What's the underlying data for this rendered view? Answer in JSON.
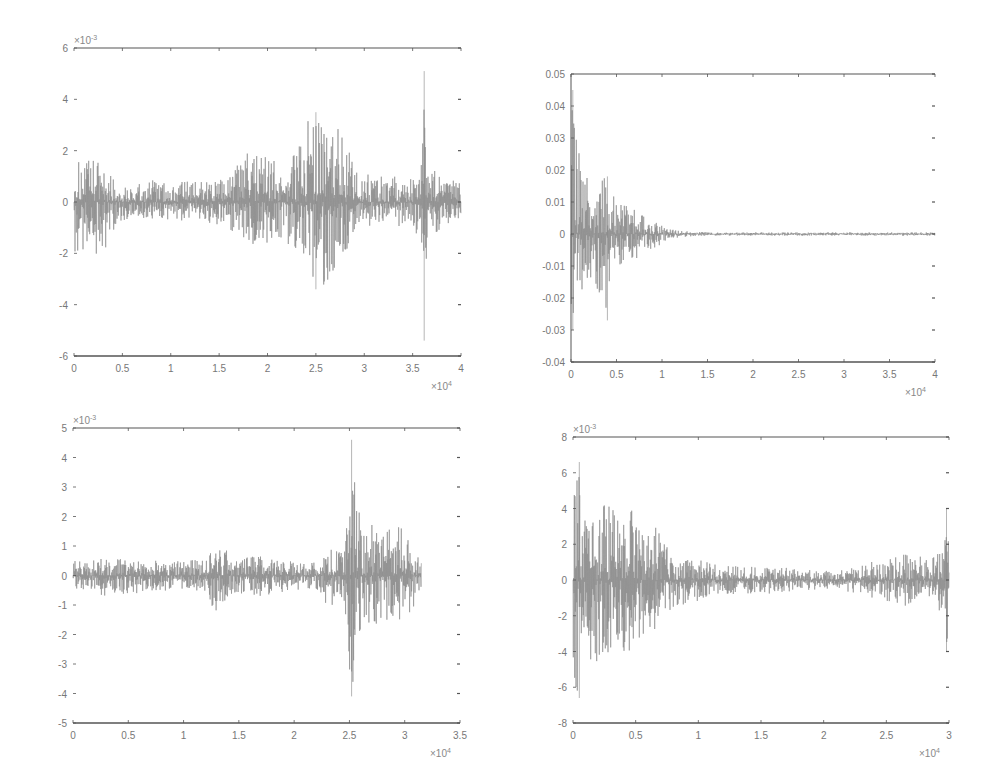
{
  "figure": {
    "background": "#ffffff",
    "signal_color": "#8a8a8a",
    "axis_color": "#555555"
  },
  "chart_data": [
    {
      "type": "line",
      "id": "top-left",
      "title": "",
      "xlabel": "",
      "ylabel": "",
      "x_multiplier": "×10",
      "x_exponent": "4",
      "y_multiplier": "×10",
      "y_exponent": "-3",
      "xlim": [
        0,
        4
      ],
      "ylim": [
        -6,
        6
      ],
      "xticks": [
        0,
        0.5,
        1,
        1.5,
        2,
        2.5,
        3,
        3.5,
        4
      ],
      "xtick_labels": [
        "0",
        "0.5",
        "1",
        "1.5",
        "2",
        "2.5",
        "3",
        "3.5",
        "4"
      ],
      "yticks": [
        6,
        4,
        2,
        0,
        -2,
        -4,
        -6
      ],
      "ytick_labels": [
        "6",
        "4",
        "2",
        "0",
        "-2",
        "-4",
        "-6"
      ],
      "grid": false,
      "box": {
        "left": 74,
        "top": 48,
        "right": 461,
        "bottom": 356,
        "left_line": false
      },
      "signal_extent": [
        0,
        4
      ],
      "envelope": [
        [
          0,
          1.6,
          -2.0
        ],
        [
          0.2,
          1.7,
          -2.1
        ],
        [
          0.3,
          1.8,
          -2.2
        ],
        [
          0.45,
          0.6,
          -0.8
        ],
        [
          0.6,
          0.6,
          -0.6
        ],
        [
          0.8,
          0.9,
          -0.8
        ],
        [
          1.0,
          0.7,
          -0.7
        ],
        [
          1.3,
          0.9,
          -0.9
        ],
        [
          1.5,
          0.8,
          -0.9
        ],
        [
          1.7,
          1.6,
          -1.3
        ],
        [
          1.85,
          2.2,
          -2.2
        ],
        [
          2.0,
          1.8,
          -1.6
        ],
        [
          2.2,
          1.6,
          -1.6
        ],
        [
          2.35,
          3.0,
          -2.4
        ],
        [
          2.5,
          3.5,
          -3.3
        ],
        [
          2.6,
          2.8,
          -3.4
        ],
        [
          2.75,
          2.9,
          -2.6
        ],
        [
          2.9,
          1.4,
          -1.5
        ],
        [
          3.1,
          1.0,
          -0.8
        ],
        [
          3.3,
          1.0,
          -1.0
        ],
        [
          3.5,
          1.0,
          -1.0
        ],
        [
          3.58,
          1.5,
          -1.5
        ],
        [
          3.62,
          5.1,
          -5.4
        ],
        [
          3.67,
          1.5,
          -1.8
        ],
        [
          3.8,
          1.0,
          -1.0
        ],
        [
          3.95,
          0.8,
          -0.7
        ]
      ],
      "peaks": [
        {
          "x": 3.62,
          "max": 5.1,
          "min": -5.4
        },
        {
          "x": 2.5,
          "max": 3.5,
          "min": -3.4
        }
      ]
    },
    {
      "type": "line",
      "id": "top-right",
      "title": "",
      "xlabel": "",
      "ylabel": "",
      "x_multiplier": "×10",
      "x_exponent": "4",
      "y_multiplier": "",
      "y_exponent": "",
      "xlim": [
        0,
        4
      ],
      "ylim": [
        -0.04,
        0.05
      ],
      "xticks": [
        0,
        0.5,
        1,
        1.5,
        2,
        2.5,
        3,
        3.5,
        4
      ],
      "xtick_labels": [
        "0",
        "0.5",
        "1",
        "1.5",
        "2",
        "2.5",
        "3",
        "3.5",
        "4"
      ],
      "yticks": [
        0.05,
        0.04,
        0.03,
        0.02,
        0.01,
        0,
        -0.01,
        -0.02,
        -0.03,
        -0.04
      ],
      "ytick_labels": [
        "0.05",
        "0.04",
        "0.03",
        "0.02",
        "0.01",
        "0",
        "-0.01",
        "-0.02",
        "-0.03",
        "-0.04"
      ],
      "grid": false,
      "box": {
        "left": 571,
        "top": 74,
        "right": 935,
        "bottom": 362,
        "left_line": true
      },
      "signal_extent": [
        0,
        4
      ],
      "envelope": [
        [
          0,
          0.045,
          -0.03
        ],
        [
          0.05,
          0.035,
          -0.022
        ],
        [
          0.1,
          0.03,
          -0.02
        ],
        [
          0.2,
          0.015,
          -0.015
        ],
        [
          0.3,
          0.018,
          -0.02
        ],
        [
          0.4,
          0.018,
          -0.027
        ],
        [
          0.5,
          0.01,
          -0.01
        ],
        [
          0.7,
          0.008,
          -0.008
        ],
        [
          0.9,
          0.004,
          -0.005
        ],
        [
          1.05,
          0.002,
          -0.002
        ],
        [
          1.2,
          0.001,
          -0.001
        ],
        [
          1.5,
          0.0005,
          -0.0005
        ],
        [
          4.0,
          0.0005,
          -0.0005
        ]
      ],
      "peaks": [
        {
          "x": 0.02,
          "max": 0.045,
          "min": -0.03
        },
        {
          "x": 0.4,
          "max": 0.018,
          "min": -0.027
        }
      ]
    },
    {
      "type": "line",
      "id": "bottom-left",
      "title": "",
      "xlabel": "",
      "ylabel": "",
      "x_multiplier": "×10",
      "x_exponent": "4",
      "y_multiplier": "×10",
      "y_exponent": "-3",
      "xlim": [
        0,
        3.5
      ],
      "ylim": [
        -5,
        5
      ],
      "xticks": [
        0,
        0.5,
        1,
        1.5,
        2,
        2.5,
        3,
        3.5
      ],
      "xtick_labels": [
        "0",
        "0.5",
        "1",
        "1.5",
        "2",
        "2.5",
        "3",
        "3.5"
      ],
      "yticks": [
        5,
        4,
        3,
        2,
        1,
        0,
        -1,
        -2,
        -3,
        -4,
        -5
      ],
      "ytick_labels": [
        "5",
        "4",
        "3",
        "2",
        "1",
        "0",
        "-1",
        "-2",
        "-3",
        "-4",
        "-5"
      ],
      "grid": false,
      "box": {
        "left": 73,
        "top": 428,
        "right": 460,
        "bottom": 723,
        "left_line": false
      },
      "signal_extent": [
        0,
        3.15
      ],
      "envelope": [
        [
          0,
          0.5,
          -0.5
        ],
        [
          0.3,
          0.6,
          -0.7
        ],
        [
          0.6,
          0.5,
          -0.6
        ],
        [
          1.0,
          0.5,
          -0.5
        ],
        [
          1.2,
          0.6,
          -0.6
        ],
        [
          1.28,
          1.4,
          -1.3
        ],
        [
          1.35,
          1.0,
          -1.2
        ],
        [
          1.45,
          0.6,
          -0.6
        ],
        [
          1.7,
          0.7,
          -0.7
        ],
        [
          2.0,
          0.5,
          -0.5
        ],
        [
          2.22,
          0.5,
          -0.5
        ],
        [
          2.3,
          1.0,
          -1.1
        ],
        [
          2.45,
          0.8,
          -0.8
        ],
        [
          2.52,
          4.6,
          -4.1
        ],
        [
          2.56,
          2.6,
          -2.4
        ],
        [
          2.65,
          1.8,
          -1.8
        ],
        [
          2.75,
          2.0,
          -1.7
        ],
        [
          2.9,
          1.6,
          -1.4
        ],
        [
          3.0,
          1.7,
          -1.7
        ],
        [
          3.1,
          0.9,
          -1.2
        ],
        [
          3.15,
          0.7,
          -0.7
        ]
      ],
      "peaks": [
        {
          "x": 2.52,
          "max": 4.6,
          "min": -4.1
        }
      ]
    },
    {
      "type": "line",
      "id": "bottom-right",
      "title": "",
      "xlabel": "",
      "ylabel": "",
      "x_multiplier": "×10",
      "x_exponent": "4",
      "y_multiplier": "×10",
      "y_exponent": "-3",
      "xlim": [
        0,
        3
      ],
      "ylim": [
        -8,
        8
      ],
      "xticks": [
        0,
        0.5,
        1,
        1.5,
        2,
        2.5,
        3
      ],
      "xtick_labels": [
        "0",
        "0.5",
        "1",
        "1.5",
        "2",
        "2.5",
        "3"
      ],
      "yticks": [
        8,
        6,
        4,
        2,
        0,
        -2,
        -4,
        -6,
        -8
      ],
      "ytick_labels": [
        "8",
        "6",
        "4",
        "2",
        "0",
        "-2",
        "-4",
        "-6",
        "-8"
      ],
      "grid": false,
      "box": {
        "left": 573,
        "top": 437,
        "right": 949,
        "bottom": 723,
        "left_line": false
      },
      "signal_extent": [
        0,
        3
      ],
      "envelope": [
        [
          0,
          4.5,
          -5.5
        ],
        [
          0.05,
          6.6,
          -6.6
        ],
        [
          0.1,
          3.4,
          -4.2
        ],
        [
          0.2,
          4.3,
          -5.0
        ],
        [
          0.3,
          4.2,
          -4.3
        ],
        [
          0.4,
          3.5,
          -4.0
        ],
        [
          0.5,
          4.2,
          -4.5
        ],
        [
          0.6,
          3.0,
          -3.0
        ],
        [
          0.7,
          3.0,
          -2.7
        ],
        [
          0.8,
          1.0,
          -1.5
        ],
        [
          1.0,
          1.2,
          -1.2
        ],
        [
          1.2,
          0.8,
          -0.8
        ],
        [
          1.5,
          0.8,
          -0.8
        ],
        [
          2.0,
          0.5,
          -0.5
        ],
        [
          2.3,
          0.8,
          -0.8
        ],
        [
          2.5,
          1.3,
          -1.3
        ],
        [
          2.7,
          1.6,
          -1.5
        ],
        [
          2.85,
          1.0,
          -0.9
        ],
        [
          2.95,
          2.5,
          -2.0
        ],
        [
          2.98,
          4.0,
          -4.0
        ],
        [
          3.0,
          2.5,
          -2.5
        ]
      ],
      "peaks": [
        {
          "x": 0.05,
          "max": 6.6,
          "min": -6.6
        },
        {
          "x": 2.98,
          "max": 4.0,
          "min": -4.0
        }
      ]
    }
  ]
}
